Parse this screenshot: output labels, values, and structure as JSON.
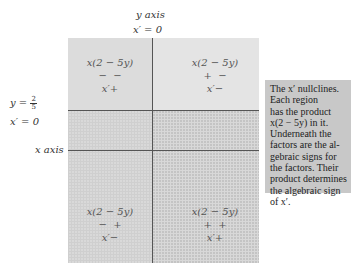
{
  "labels": {
    "y_axis": "y axis",
    "x_prime_zero_top": "x′ = 0",
    "y_eq": "y =",
    "y_frac_num": "2",
    "y_frac_den": "5",
    "x_prime_zero_left": "x′ = 0",
    "x_axis": "x axis"
  },
  "regions": [
    {
      "id": "top-left",
      "product": "x(2 − 5y)",
      "signs": "−  −",
      "result": "x′+"
    },
    {
      "id": "top-right",
      "product": "x(2 − 5y)",
      "signs": "+  −",
      "result": "x′−"
    },
    {
      "id": "bottom-left",
      "product": "x(2 − 5y)",
      "signs": "−  +",
      "result": "x′−"
    },
    {
      "id": "bottom-right",
      "product": "x(2 − 5y)",
      "signs": "+  +",
      "result": "x′+"
    }
  ],
  "note": {
    "lines": [
      "The x′ nullclines.",
      "Each region",
      "has the product",
      "x(2 − 5y) in it.",
      "Underneath the",
      "factors are the al-",
      "gebraic signs for",
      "the factors. Their",
      "product determines",
      "the algebraic sign",
      "of x′."
    ]
  },
  "colors": {
    "top_region": "#dcdcdc",
    "bottom_left_region": "#d9d9d9",
    "bottom_right_region": "#c4c4c4",
    "note_bg": "#c8c8c8",
    "lines": "#555555"
  }
}
